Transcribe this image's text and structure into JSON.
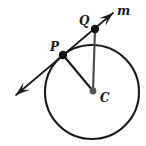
{
  "figure": {
    "background_color": "#fdfdfd",
    "stroke_color": "#1a1a1a",
    "width": 146,
    "height": 146
  },
  "labels": {
    "point_p": "P",
    "point_q": "Q",
    "point_c": "C",
    "line_m": "m"
  },
  "geometry": {
    "circle": {
      "cx": 92,
      "cy": 92,
      "r": 47,
      "stroke_width": 2.1
    },
    "points": [
      {
        "name": "P",
        "x": 63,
        "y": 55,
        "r": 4.2,
        "on_circle": true
      },
      {
        "name": "Q",
        "x": 95,
        "y": 29,
        "r": 4.2,
        "on_circle": false
      },
      {
        "name": "C",
        "x": 93,
        "y": 91,
        "r": 3.4,
        "on_circle": false
      }
    ],
    "segments": [
      {
        "name": "radius-CP",
        "x1": 93,
        "y1": 91,
        "x2": 63,
        "y2": 55,
        "stroke_width": 2.1
      },
      {
        "name": "segment-CQ",
        "x1": 93,
        "y1": 91,
        "x2": 95,
        "y2": 29,
        "stroke_width": 2.1
      }
    ],
    "line_m": {
      "name": "tangent-line-m",
      "x1": 16,
      "y1": 95,
      "x2": 113,
      "y2": 13,
      "stroke_width": 1.7,
      "arrow_start": true,
      "arrow_end": true
    }
  }
}
